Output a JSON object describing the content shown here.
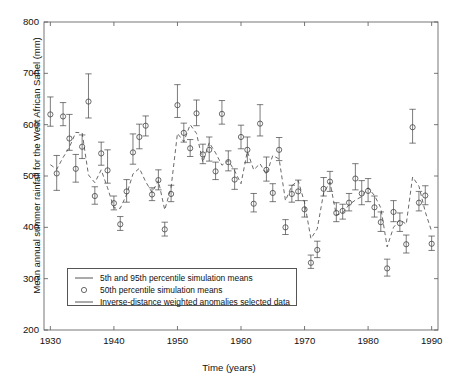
{
  "chart_data": {
    "type": "scatter",
    "title": "",
    "xlabel": "Time (years)",
    "ylabel": "Mean annual summer rainfall for the West African Sahel (mm)",
    "xlim": [
      1929,
      1991
    ],
    "ylim": [
      200,
      800
    ],
    "xticks": [
      1930,
      1940,
      1950,
      1960,
      1970,
      1980,
      1990
    ],
    "yticks": [
      200,
      300,
      400,
      500,
      600,
      700,
      800
    ],
    "xtick_labels": [
      "1930",
      "1940",
      "1950",
      "1960",
      "1970",
      "1980",
      "1990"
    ],
    "ytick_labels": [
      "200",
      "300",
      "400",
      "500",
      "600",
      "700",
      "800"
    ],
    "grid": false,
    "legend_position": "lower left",
    "legend": [
      {
        "key": "percentile-band",
        "marker": "line",
        "label": "5th and 95th percentile simulation means"
      },
      {
        "key": "median-marker",
        "marker": "circle",
        "label": "50th percentile simulation means"
      },
      {
        "key": "observed-line",
        "marker": "line",
        "label": "Inverse-distance weighted anomalies selected data"
      }
    ],
    "x": [
      1930,
      1931,
      1932,
      1933,
      1934,
      1935,
      1936,
      1937,
      1938,
      1939,
      1940,
      1941,
      1942,
      1943,
      1944,
      1945,
      1946,
      1947,
      1948,
      1949,
      1950,
      1951,
      1952,
      1953,
      1954,
      1955,
      1956,
      1957,
      1958,
      1959,
      1960,
      1961,
      1962,
      1963,
      1964,
      1965,
      1966,
      1967,
      1968,
      1969,
      1970,
      1971,
      1972,
      1973,
      1974,
      1975,
      1976,
      1977,
      1978,
      1979,
      1980,
      1981,
      1982,
      1983,
      1984,
      1985,
      1986,
      1987,
      1988,
      1989,
      1990
    ],
    "series": [
      {
        "name": "50th percentile simulation means",
        "key": "median",
        "values": [
          620,
          505,
          616,
          573,
          514,
          557,
          645,
          461,
          544,
          511,
          447,
          406,
          470,
          546,
          576,
          598,
          464,
          492,
          396,
          465,
          638,
          584,
          554,
          622,
          542,
          551,
          509,
          621,
          527,
          493,
          576,
          551,
          446,
          602,
          512,
          467,
          551,
          400,
          465,
          470,
          435,
          331,
          356,
          475,
          489,
          428,
          432,
          448,
          495,
          466,
          471,
          439,
          410,
          320,
          430,
          408,
          367,
          595,
          448,
          462,
          368
        ]
      },
      {
        "name": "5th percentile simulation means",
        "key": "lower",
        "values": [
          597,
          472,
          598,
          550,
          488,
          534,
          613,
          445,
          521,
          486,
          434,
          394,
          449,
          523,
          553,
          578,
          452,
          473,
          383,
          450,
          614,
          566,
          538,
          598,
          524,
          529,
          493,
          601,
          510,
          474,
          553,
          526,
          430,
          578,
          490,
          450,
          530,
          386,
          449,
          452,
          420,
          320,
          341,
          461,
          470,
          411,
          416,
          432,
          473,
          444,
          450,
          420,
          392,
          305,
          411,
          392,
          350,
          564,
          432,
          444,
          355
        ]
      },
      {
        "name": "95th percentile simulation means",
        "key": "upper",
        "values": [
          654,
          540,
          643,
          620,
          542,
          580,
          699,
          479,
          566,
          551,
          461,
          421,
          493,
          582,
          601,
          617,
          477,
          512,
          410,
          482,
          678,
          603,
          571,
          648,
          562,
          576,
          527,
          647,
          549,
          514,
          599,
          576,
          466,
          639,
          537,
          485,
          575,
          415,
          482,
          492,
          452,
          346,
          373,
          497,
          509,
          448,
          445,
          466,
          524,
          491,
          495,
          461,
          430,
          338,
          452,
          428,
          385,
          630,
          470,
          481,
          383
        ]
      },
      {
        "name": "Inverse-distance weighted anomalies selected data",
        "key": "observed",
        "values": [
          522,
          513,
          536,
          556,
          585,
          584,
          502,
          487,
          512,
          477,
          438,
          437,
          464,
          504,
          515,
          489,
          468,
          491,
          434,
          478,
          583,
          567,
          600,
          583,
          527,
          565,
          545,
          521,
          530,
          510,
          485,
          548,
          512,
          524,
          503,
          540,
          533,
          452,
          481,
          491,
          448,
          378,
          397,
          467,
          488,
          424,
          428,
          444,
          453,
          460,
          477,
          462,
          438,
          362,
          400,
          415,
          406,
          498,
          480,
          430,
          392
        ]
      }
    ]
  },
  "figure": {
    "background_color": "#ffffff",
    "axis_color": "#555555",
    "data_color": "#444444",
    "marker": "open-circle"
  }
}
